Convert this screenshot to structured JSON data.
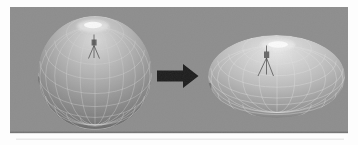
{
  "figure": {
    "type": "before-after-3d-illustration",
    "background_color": "#fdfdfd",
    "panel": {
      "color": "#8d8d8d",
      "edge_color": "#6f6f6f",
      "artifact_line_color": "#d2d2d2"
    },
    "arrow": {
      "name": "transform-arrow-right",
      "color": "#1c1c1c"
    },
    "left_object": {
      "name": "original-sphere",
      "surface_top_color": "#d9d9d9",
      "surface_mid_color": "#a8a8a8",
      "surface_bottom_color": "#434343",
      "wireframe_color": "#d4d4d4",
      "highlight_color": "#fafafa",
      "manipulator_color": "#4a4a4a"
    },
    "right_object": {
      "name": "squashed-sphere",
      "surface_top_color": "#e7e7e7",
      "surface_mid_color": "#bcbcbc",
      "surface_bottom_color": "#515151",
      "wireframe_color": "#e2e2e2",
      "highlight_color": "#fcfcfc",
      "manipulator_color": "#4a4a4a"
    }
  }
}
